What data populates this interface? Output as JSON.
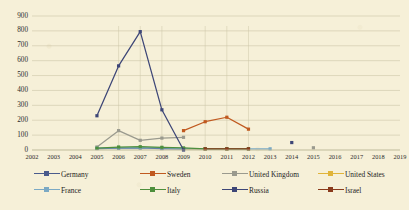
{
  "chart_data": {
    "type": "line",
    "title": "",
    "xlabel": "",
    "ylabel": "",
    "x": [
      2002,
      2003,
      2004,
      2005,
      2006,
      2007,
      2008,
      2009,
      2010,
      2011,
      2012,
      2013,
      2014,
      2015,
      2016,
      2017,
      2018,
      2019
    ],
    "xtick_labels": [
      "2002",
      "2003",
      "2004",
      "2005",
      "2006",
      "2007",
      "2008",
      "2009",
      "2010",
      "2011",
      "2012",
      "2013",
      "2014",
      "2015",
      "2016",
      "2017",
      "2018",
      "2019"
    ],
    "ytick_labels": [
      "0",
      "100",
      "200",
      "300",
      "400",
      "500",
      "600",
      "700",
      "800",
      "900"
    ],
    "ytick_values": [
      0,
      100,
      200,
      300,
      400,
      500,
      600,
      700,
      800,
      900
    ],
    "ylim": [
      0,
      900
    ],
    "grid": "horizontal",
    "legend_position": "bottom",
    "series": [
      {
        "name": "Germany",
        "color": "#4a5b8c",
        "x": [
          2005,
          2006,
          2007,
          2008,
          2009
        ],
        "values": [
          10,
          12,
          14,
          10,
          8
        ]
      },
      {
        "name": "Sweden",
        "color": "#c0591f",
        "x": [
          2009,
          2010,
          2011,
          2012
        ],
        "values": [
          130,
          190,
          220,
          140
        ]
      },
      {
        "name": "United Kingdom",
        "color": "#9a9a8e",
        "x": [
          2005,
          2006,
          2007,
          2008,
          2009,
          2015
        ],
        "values": [
          20,
          130,
          65,
          80,
          85,
          15
        ]
      },
      {
        "name": "United States",
        "color": "#e0b43a",
        "x": [
          2009,
          2010,
          2011,
          2012
        ],
        "values": [
          8,
          8,
          8,
          8
        ]
      },
      {
        "name": "France",
        "color": "#7ba9c4",
        "x": [
          2005,
          2006,
          2007,
          2008,
          2009,
          2010,
          2011,
          2012,
          2013
        ],
        "values": [
          12,
          14,
          16,
          14,
          10,
          8,
          8,
          8,
          8
        ]
      },
      {
        "name": "Italy",
        "color": "#4e8f3c",
        "x": [
          2005,
          2006,
          2007,
          2008,
          2009,
          2010,
          2011,
          2012
        ],
        "values": [
          12,
          20,
          22,
          18,
          14,
          8,
          8,
          8
        ]
      },
      {
        "name": "Russia",
        "color": "#3d4677",
        "x": [
          2005,
          2006,
          2007,
          2008,
          2009,
          2014
        ],
        "values": [
          230,
          565,
          795,
          270,
          0,
          50
        ]
      },
      {
        "name": "Israel",
        "color": "#8a3b1c",
        "x": [
          2010,
          2011,
          2012
        ],
        "values": [
          8,
          8,
          8
        ]
      }
    ],
    "legend_entries": [
      {
        "label": "Germany",
        "color": "#4a5b8c"
      },
      {
        "label": "Sweden",
        "color": "#c0591f"
      },
      {
        "label": "United Kingdom",
        "color": "#9a9a8e"
      },
      {
        "label": "United States",
        "color": "#e0b43a"
      },
      {
        "label": "France",
        "color": "#7ba9c4"
      },
      {
        "label": "Italy",
        "color": "#4e8f3c"
      },
      {
        "label": "Russia",
        "color": "#3d4677"
      },
      {
        "label": "Israel",
        "color": "#8a3b1c"
      }
    ]
  },
  "colors": {
    "background": "#f6f0d8",
    "grid": "#cdc6a8",
    "text": "#2b2b2b"
  }
}
